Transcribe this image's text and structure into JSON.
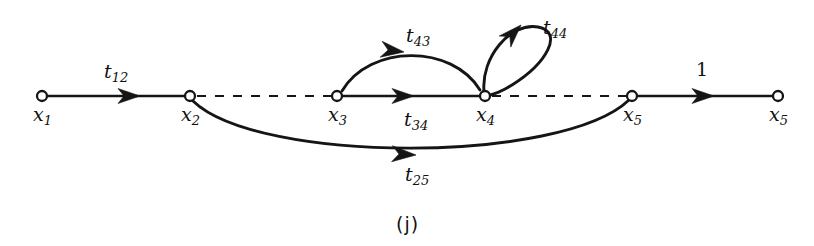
{
  "figure": {
    "caption": "(j)",
    "type": "signal-flow-graph",
    "width": 814,
    "height": 246,
    "background_color": "#ffffff",
    "ink_color": "#151515"
  },
  "nodes": [
    {
      "id": "x1",
      "symbol": "x",
      "subscript": "1",
      "x": 42,
      "y": 96,
      "label_x": 33,
      "label_y": 105
    },
    {
      "id": "x2",
      "symbol": "x",
      "subscript": "2",
      "x": 190,
      "y": 96,
      "label_x": 181,
      "label_y": 105
    },
    {
      "id": "x3",
      "symbol": "x",
      "subscript": "3",
      "x": 337,
      "y": 96,
      "label_x": 328,
      "label_y": 105
    },
    {
      "id": "x4",
      "symbol": "x",
      "subscript": "4",
      "x": 485,
      "y": 96,
      "label_x": 476,
      "label_y": 105
    },
    {
      "id": "x5",
      "symbol": "x",
      "subscript": "5",
      "x": 632,
      "y": 96,
      "label_x": 623,
      "label_y": 105
    },
    {
      "id": "x5out",
      "symbol": "x",
      "subscript": "5",
      "x": 778,
      "y": 96,
      "label_x": 769,
      "label_y": 105
    }
  ],
  "edges": [
    {
      "id": "e12",
      "from": "x1",
      "to": "x2",
      "style": "solid",
      "shape": "straight",
      "gain_symbol": "t",
      "gain_subscript": "12",
      "gain_x": 104,
      "gain_y": 62
    },
    {
      "id": "e23dash",
      "from": "x2",
      "to": "x3",
      "style": "dashed",
      "shape": "straight",
      "gain_symbol": "",
      "gain_subscript": ""
    },
    {
      "id": "e34",
      "from": "x3",
      "to": "x4",
      "style": "solid",
      "shape": "straight",
      "gain_symbol": "t",
      "gain_subscript": "34",
      "gain_x": 404,
      "gain_y": 110
    },
    {
      "id": "e45dash",
      "from": "x4",
      "to": "x5",
      "style": "dashed",
      "shape": "straight",
      "gain_symbol": "",
      "gain_subscript": ""
    },
    {
      "id": "e55",
      "from": "x5",
      "to": "x5out",
      "style": "solid",
      "shape": "straight",
      "gain_symbol": "1",
      "gain_subscript": "",
      "gain_x": 696,
      "gain_y": 60,
      "unity": true
    },
    {
      "id": "e43",
      "from": "x4",
      "to": "x3",
      "style": "solid",
      "shape": "arc-above",
      "gain_symbol": "t",
      "gain_subscript": "43",
      "gain_x": 406,
      "gain_y": 26
    },
    {
      "id": "e44",
      "from": "x4",
      "to": "x4",
      "style": "solid",
      "shape": "self-loop",
      "gain_symbol": "t",
      "gain_subscript": "44",
      "gain_x": 543,
      "gain_y": 18
    },
    {
      "id": "e25",
      "from": "x2",
      "to": "x5",
      "style": "solid",
      "shape": "arc-below",
      "gain_symbol": "t",
      "gain_subscript": "25",
      "gain_x": 405,
      "gain_y": 165
    }
  ],
  "geometry": {
    "baseline_y": 96,
    "node_radius": 5,
    "arc_43": {
      "path": "M 480 90 C 452 44, 370 44, 342 91",
      "arrow_x": 418,
      "arrow_y": 51,
      "arrow_angle": 192
    },
    "loop_44": {
      "path": "M 484 92 C 483 58, 512 24, 540 28 C 563 32, 548 62, 513 84 C 500 92, 490 95, 486 96",
      "arrow_x": 519,
      "arrow_y": 27,
      "arrow_angle": -38
    },
    "arc_25": {
      "path": "M 193 101 C 255 162, 560 162, 629 100",
      "arrow_x": 412,
      "arrow_y": 155,
      "arrow_angle": 2
    },
    "arrow_12": {
      "x": 140,
      "y": 96,
      "angle": 0
    },
    "arrow_34": {
      "x": 414,
      "y": 96,
      "angle": 0
    },
    "arrow_55": {
      "x": 714,
      "y": 96,
      "angle": 0
    }
  }
}
